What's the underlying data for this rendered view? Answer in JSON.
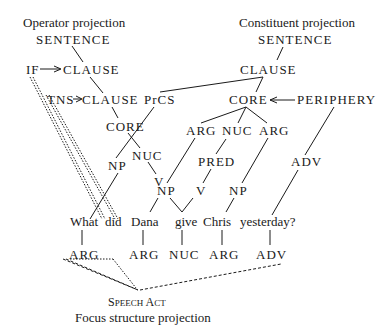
{
  "titles": {
    "operator": "Operator projection",
    "constituent": "Constituent projection",
    "focus": "Focus structure projection"
  },
  "operator": {
    "sentence": "SENTENCE",
    "if": "IF",
    "clause1": "CLAUSE",
    "tns": "TNS",
    "clause2": "CLAUSE",
    "core": "CORE",
    "nuc": "NUC",
    "v": "V"
  },
  "constituent": {
    "sentence": "SENTENCE",
    "clause": "CLAUSE",
    "prcs": "PrCS",
    "core": "CORE",
    "periphery": "PERIPHERY",
    "arg1": "ARG",
    "nuc": "NUC",
    "arg2": "ARG",
    "pred": "PRED",
    "adv": "ADV",
    "np_prcs": "NP",
    "np_arg1": "NP",
    "v": "V",
    "np_arg2": "NP"
  },
  "words": [
    "What",
    "did",
    "Dana",
    "give",
    "Chris",
    "yesterday?"
  ],
  "focus": {
    "labels": [
      "ARG",
      "ARG",
      "NUC",
      "ARG",
      "ADV"
    ],
    "speech_act_cap1": "S",
    "speech_act_rest1": "PEECH",
    "speech_act_cap2": "A",
    "speech_act_rest2": "CT"
  }
}
